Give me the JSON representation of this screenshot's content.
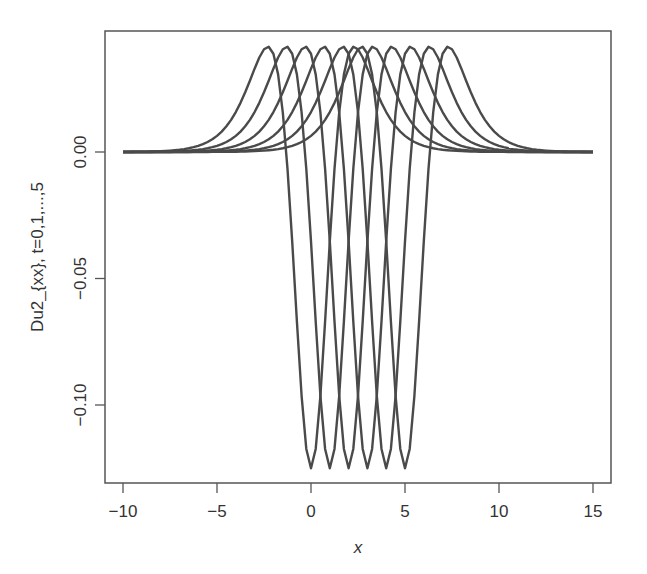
{
  "chart_data": {
    "type": "line",
    "title": "",
    "xlabel": "x",
    "ylabel": "Du2_{xx}, t=0,1,...,5",
    "xlim": [
      -11,
      16
    ],
    "ylim": [
      -0.132,
      0.048
    ],
    "xticks": [
      -10,
      -5,
      0,
      5,
      10,
      15
    ],
    "xtick_labels": [
      "−10",
      "−5",
      "0",
      "5",
      "10",
      "15"
    ],
    "yticks": [
      0.0,
      -0.05,
      -0.1
    ],
    "ytick_labels": [
      "0.00",
      "−0.05",
      "−0.10"
    ],
    "grid": false,
    "legend": null,
    "x_range": [
      -10,
      15
    ],
    "series": [
      {
        "name": "t=0",
        "center": 0,
        "min": -0.125,
        "max": 0.0417
      },
      {
        "name": "t=1",
        "center": 1,
        "min": -0.125,
        "max": 0.0417
      },
      {
        "name": "t=2",
        "center": 2,
        "min": -0.125,
        "max": 0.0417
      },
      {
        "name": "t=3",
        "center": 3,
        "min": -0.125,
        "max": 0.0417
      },
      {
        "name": "t=4",
        "center": 4,
        "min": -0.125,
        "max": 0.0417
      },
      {
        "name": "t=5",
        "center": 5,
        "min": -0.125,
        "max": 0.0417
      }
    ],
    "line_color": "#4a4a4a",
    "axis_color": "#555555"
  }
}
